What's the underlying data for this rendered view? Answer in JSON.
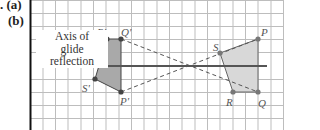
{
  "part_labels": {
    "a": ". (a)",
    "b": "(b)"
  },
  "axis_label": {
    "line1": "Axis of",
    "line2": "glide",
    "line3": "reflection"
  },
  "points": {
    "original": {
      "P": "P",
      "Q": "Q",
      "R": "R",
      "S": "S"
    },
    "image": {
      "P": "P'",
      "Q": "Q'",
      "R": "R'",
      "S": "S'"
    }
  },
  "colors": {
    "grid": "#b8b8b8",
    "border": "#111111",
    "axis": "#555555",
    "shape_fill_image": "#a9a9a9",
    "shape_fill_original": "#d6d6d6",
    "dashed": "#555555",
    "point": "#444444"
  }
}
